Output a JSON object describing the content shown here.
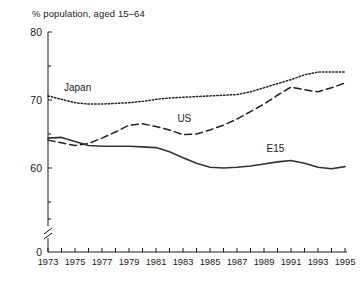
{
  "chart_data": {
    "type": "line",
    "title": "% population, aged 15–64",
    "xlabel": "",
    "ylabel": "",
    "ylim": [
      0,
      80
    ],
    "xlim": [
      1973,
      1995
    ],
    "y_break": true,
    "y_break_note": "axis broken between 0 and ~57",
    "grid": false,
    "legend_position": "inline-labels",
    "y_ticks_labeled": [
      "80",
      "70",
      "60",
      "0"
    ],
    "y_tick_values": [
      80,
      70,
      60,
      0
    ],
    "y_minor_ticks": [
      75,
      65,
      55
    ],
    "x_ticks_labeled": [
      "1973",
      "1975",
      "1977",
      "1979",
      "1981",
      "1983",
      "1985",
      "1987",
      "1989",
      "1991",
      "1993",
      "1995"
    ],
    "x_all_years": [
      1973,
      1974,
      1975,
      1976,
      1977,
      1978,
      1979,
      1980,
      1981,
      1982,
      1983,
      1984,
      1985,
      1986,
      1987,
      1988,
      1989,
      1990,
      1991,
      1992,
      1993,
      1994,
      1995
    ],
    "series": [
      {
        "name": "Japan",
        "style": "dotted",
        "color": "#222222",
        "label_x": 1975.0,
        "label_y": 71.6,
        "values": [
          70.6,
          70.1,
          69.6,
          69.4,
          69.4,
          69.5,
          69.6,
          69.8,
          70.1,
          70.3,
          70.4,
          70.5,
          70.6,
          70.7,
          70.8,
          71.2,
          71.8,
          72.4,
          73.0,
          73.7,
          74.1,
          74.1,
          74.1
        ]
      },
      {
        "name": "US",
        "style": "dashed",
        "color": "#222222",
        "label_x": 1983.4,
        "label_y": 67.1,
        "values": [
          64.1,
          63.7,
          63.3,
          63.6,
          64.4,
          65.3,
          66.3,
          66.5,
          66.1,
          65.6,
          64.9,
          65.0,
          65.6,
          66.3,
          67.2,
          68.3,
          69.4,
          70.7,
          71.9,
          71.5,
          71.2,
          71.8,
          72.5
        ]
      },
      {
        "name": "E15",
        "style": "solid",
        "color": "#333333",
        "label_x": 1990.0,
        "label_y": 62.7,
        "values": [
          64.4,
          64.5,
          63.9,
          63.3,
          63.2,
          63.2,
          63.2,
          63.1,
          63.0,
          62.4,
          61.5,
          60.7,
          60.1,
          60.0,
          60.1,
          60.3,
          60.6,
          60.9,
          61.1,
          60.7,
          60.1,
          59.9,
          60.2
        ]
      }
    ]
  }
}
